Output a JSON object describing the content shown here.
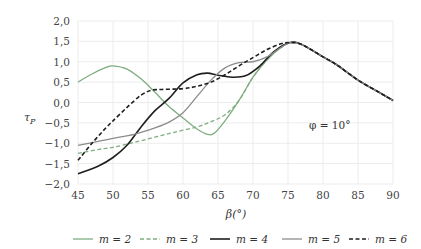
{
  "chart_data": {
    "type": "line",
    "title": "",
    "xlabel": "β(°)",
    "ylabel": "τ_P",
    "xlim": [
      45,
      90
    ],
    "ylim": [
      -2.0,
      2.0
    ],
    "grid": true,
    "legend_position": "bottom",
    "x_ticks": [
      45,
      50,
      55,
      60,
      65,
      70,
      75,
      80,
      85,
      90
    ],
    "x_tick_labels": [
      "45",
      "50",
      "55",
      "60",
      "65",
      "70",
      "75",
      "80",
      "85",
      "90"
    ],
    "y_ticks": [
      2.0,
      1.5,
      1.0,
      0.5,
      0.0,
      -0.5,
      -1.0,
      -1.5,
      -2.0
    ],
    "y_tick_labels": [
      "2,0",
      "1,5",
      "1,0",
      "0,5",
      "0,0",
      "−0,5",
      "−1,0",
      "−1,5",
      "−2,0"
    ],
    "annotation": "φ = 10°",
    "annotation_pos": {
      "x": 78,
      "y": -0.55
    },
    "series": [
      {
        "name": "m = 2",
        "color": "#7fae80",
        "dash": "solid",
        "width": 1.3,
        "x": [
          45,
          47,
          49,
          50,
          52,
          54,
          56,
          58,
          60,
          62,
          63.5,
          64.5,
          66,
          68,
          70,
          72,
          74,
          75.3,
          77,
          80,
          82,
          85,
          88,
          90
        ],
        "values": [
          0.5,
          0.7,
          0.86,
          0.9,
          0.82,
          0.58,
          0.25,
          -0.1,
          -0.38,
          -0.65,
          -0.78,
          -0.75,
          -0.45,
          0.05,
          0.62,
          1.05,
          1.35,
          1.47,
          1.42,
          1.12,
          0.92,
          0.55,
          0.25,
          0.05
        ]
      },
      {
        "name": "m = 3",
        "color": "#7fae80",
        "dash": "dashed",
        "width": 1.3,
        "x": [
          45,
          48,
          50,
          53,
          56,
          59,
          62,
          64,
          66,
          68,
          70,
          72,
          74,
          75.3,
          77,
          80,
          82,
          85,
          88,
          90
        ],
        "values": [
          -1.25,
          -1.15,
          -1.1,
          -0.98,
          -0.85,
          -0.72,
          -0.6,
          -0.47,
          -0.3,
          0.05,
          0.62,
          1.05,
          1.35,
          1.47,
          1.42,
          1.12,
          0.92,
          0.55,
          0.25,
          0.05
        ]
      },
      {
        "name": "m = 4",
        "color": "#1e1e1e",
        "dash": "solid",
        "width": 1.6,
        "x": [
          45,
          48,
          50,
          52,
          54,
          56,
          58,
          60,
          62,
          63.5,
          65,
          67,
          69,
          71,
          73,
          75.3,
          77,
          80,
          82,
          85,
          88,
          90
        ],
        "values": [
          -1.75,
          -1.55,
          -1.35,
          -1.05,
          -0.6,
          -0.2,
          0.1,
          0.48,
          0.68,
          0.72,
          0.67,
          0.62,
          0.66,
          0.9,
          1.25,
          1.47,
          1.42,
          1.12,
          0.92,
          0.55,
          0.25,
          0.05
        ]
      },
      {
        "name": "m = 5",
        "color": "#8c8c8c",
        "dash": "solid",
        "width": 1.3,
        "x": [
          45,
          48,
          50,
          53,
          56,
          58,
          60,
          62,
          64,
          66,
          68,
          70,
          72,
          74,
          75.3,
          77,
          80,
          82,
          85,
          88,
          90
        ],
        "values": [
          -1.05,
          -0.95,
          -0.88,
          -0.78,
          -0.62,
          -0.48,
          -0.25,
          0.15,
          0.55,
          0.85,
          0.98,
          1.0,
          1.12,
          1.35,
          1.47,
          1.42,
          1.12,
          0.92,
          0.55,
          0.25,
          0.05
        ]
      },
      {
        "name": "m = 6",
        "color": "#1e1e1e",
        "dash": "dashed",
        "width": 1.6,
        "x": [
          45,
          47,
          49,
          50,
          52,
          54,
          55.5,
          57,
          60,
          62,
          64,
          66,
          68,
          70,
          72,
          74,
          75.3,
          77,
          80,
          82,
          85,
          88,
          90
        ],
        "values": [
          -1.42,
          -1.0,
          -0.62,
          -0.45,
          -0.12,
          0.18,
          0.3,
          0.32,
          0.34,
          0.4,
          0.5,
          0.68,
          0.9,
          1.1,
          1.3,
          1.44,
          1.47,
          1.42,
          1.12,
          0.92,
          0.55,
          0.25,
          0.05
        ]
      }
    ]
  }
}
